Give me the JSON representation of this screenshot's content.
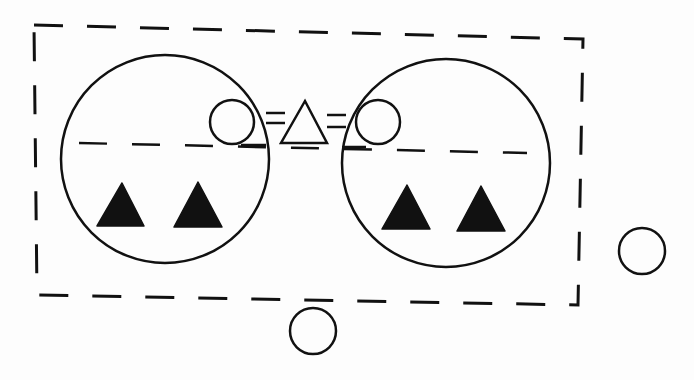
{
  "diagram": {
    "type": "symbolic-kinship-diagram",
    "colors": {
      "background": "#fdfdfd",
      "stroke": "#111111",
      "fill": "#111111"
    },
    "boundary": {
      "shape": "dashed-rectangle",
      "points": [
        [
          34,
          25
        ],
        [
          583,
          39
        ],
        [
          578,
          305
        ],
        [
          37,
          295
        ]
      ]
    },
    "divider": {
      "shape": "dashed-line",
      "from": [
        79,
        143
      ],
      "to": [
        527,
        153
      ]
    },
    "groups": [
      {
        "id": "left-group",
        "circle": {
          "cx": 165,
          "cy": 159,
          "r": 104
        },
        "filled_triangles": [
          {
            "points": [
              [
                122,
                183
              ],
              [
                97,
                226
              ],
              [
                144,
                226
              ]
            ]
          },
          {
            "points": [
              [
                198,
                182
              ],
              [
                174,
                227
              ],
              [
                222,
                227
              ]
            ]
          }
        ]
      },
      {
        "id": "right-group",
        "circle": {
          "cx": 446,
          "cy": 163,
          "r": 104
        },
        "filled_triangles": [
          {
            "points": [
              [
                407,
                185
              ],
              [
                382,
                229
              ],
              [
                430,
                229
              ]
            ]
          },
          {
            "points": [
              [
                481,
                186
              ],
              [
                457,
                231
              ],
              [
                505,
                231
              ]
            ]
          }
        ]
      }
    ],
    "center_link": {
      "left_circle": {
        "cx": 232,
        "cy": 122,
        "r": 22
      },
      "right_circle": {
        "cx": 378,
        "cy": 122,
        "r": 22
      },
      "triangle": {
        "points": [
          [
            305,
            101
          ],
          [
            281,
            143
          ],
          [
            327,
            143
          ]
        ]
      },
      "left_equals": {
        "x1": 266,
        "x2": 285,
        "y": [
          113,
          123
        ]
      },
      "right_equals": {
        "x1": 327,
        "x2": 346,
        "y": [
          115,
          127
        ]
      },
      "underlines": [
        {
          "from": [
            241,
            145
          ],
          "to": [
            266,
            145
          ]
        },
        {
          "from": [
            342,
            147
          ],
          "to": [
            366,
            147
          ]
        }
      ]
    },
    "outside_circles": [
      {
        "id": "outside-right",
        "cx": 642,
        "cy": 251,
        "r": 23
      },
      {
        "id": "outside-bottom",
        "cx": 313,
        "cy": 331,
        "r": 23
      }
    ]
  }
}
